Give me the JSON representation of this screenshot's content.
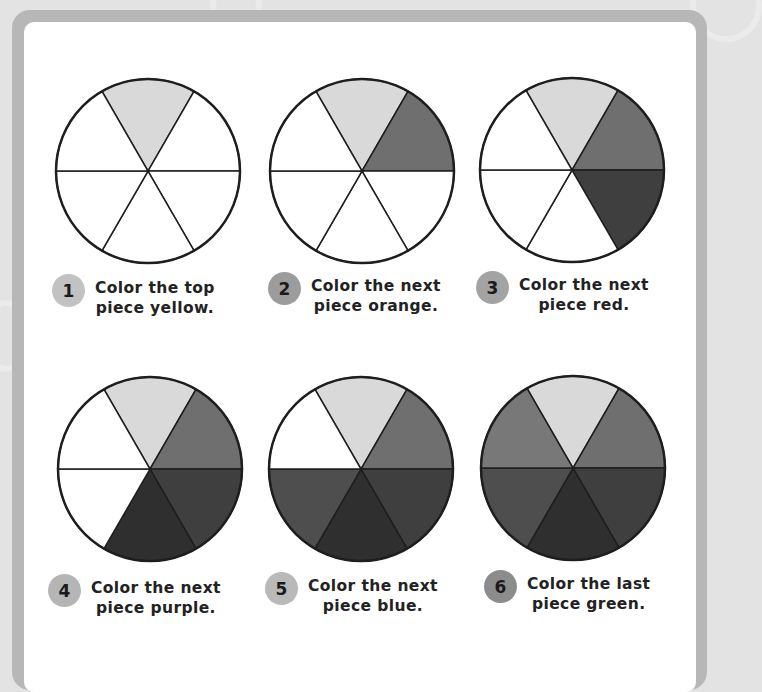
{
  "colors": {
    "background": "#e3e3e3",
    "frame": "#b7b7b7",
    "panel": "#ffffff",
    "outline": "#1e1e1e",
    "yellow": "#d9d9d9",
    "orange": "#6f6f6f",
    "red": "#3f3f3f",
    "purple": "#2f2f2f",
    "blue": "#4e4e4e",
    "green": "#787878",
    "empty": "#ffffff"
  },
  "sector_order": [
    "top",
    "top-right",
    "bottom-right",
    "bottom",
    "bottom-left",
    "top-left"
  ],
  "steps": [
    {
      "number": "1",
      "line1": "Color the top",
      "line2": "piece yellow.",
      "badge_color": "#c2c2c2",
      "fills": [
        "yellow",
        "empty",
        "empty",
        "empty",
        "empty",
        "empty"
      ]
    },
    {
      "number": "2",
      "line1": "Color the next",
      "line2": "piece orange.",
      "badge_color": "#9c9c9c",
      "fills": [
        "yellow",
        "orange",
        "empty",
        "empty",
        "empty",
        "empty"
      ]
    },
    {
      "number": "3",
      "line1": "Color the next",
      "line2": "piece red.",
      "badge_color": "#a3a3a3",
      "fills": [
        "yellow",
        "orange",
        "red",
        "empty",
        "empty",
        "empty"
      ]
    },
    {
      "number": "4",
      "line1": "Color the next",
      "line2": "piece purple.",
      "badge_color": "#b5b5b5",
      "fills": [
        "yellow",
        "orange",
        "red",
        "purple",
        "empty",
        "empty"
      ]
    },
    {
      "number": "5",
      "line1": "Color the next",
      "line2": "piece blue.",
      "badge_color": "#b9b9b9",
      "fills": [
        "yellow",
        "orange",
        "red",
        "purple",
        "blue",
        "empty"
      ]
    },
    {
      "number": "6",
      "line1": "Color the last",
      "line2": "piece green.",
      "badge_color": "#8c8c8c",
      "fills": [
        "yellow",
        "orange",
        "red",
        "purple",
        "blue",
        "green"
      ]
    }
  ]
}
